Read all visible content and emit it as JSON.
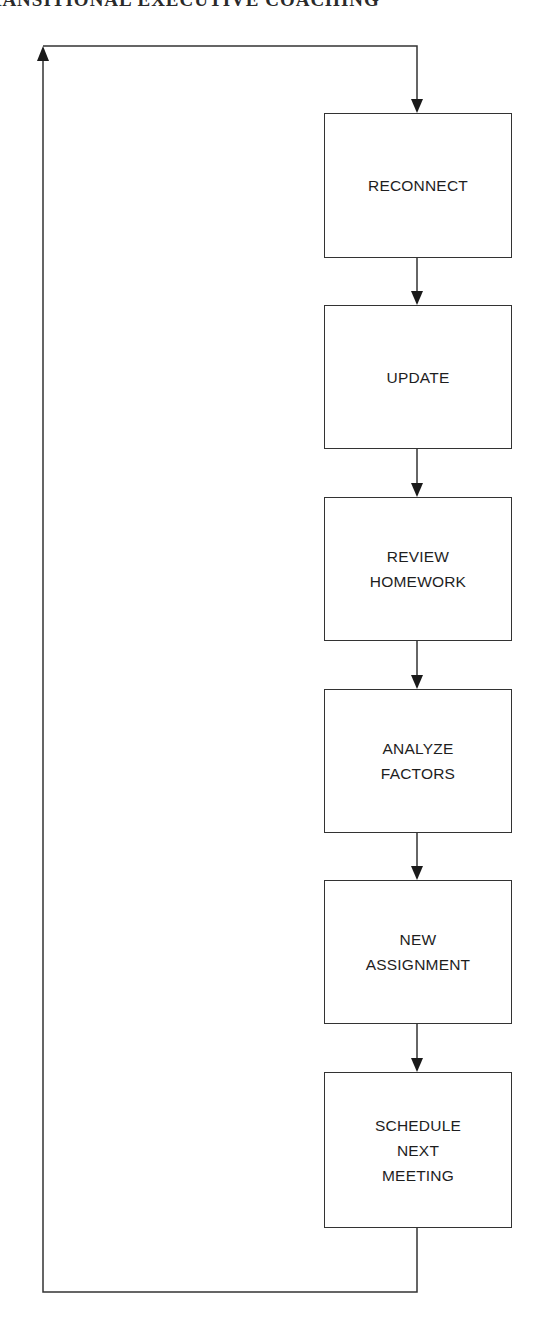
{
  "page": {
    "running_head": "TRANSITIONAL EXECUTIVE COACHING"
  },
  "diagram": {
    "type": "cyclic-flowchart",
    "line_color": "#333333",
    "steps": [
      {
        "label": "RECONNECT",
        "top": 113,
        "height": 145
      },
      {
        "label": "UPDATE",
        "top": 305,
        "height": 144
      },
      {
        "label": "REVIEW\nHOMEWORK",
        "top": 497,
        "height": 144
      },
      {
        "label": "ANALYZE\nFACTORS",
        "top": 689,
        "height": 144
      },
      {
        "label": "NEW\nASSIGNMENT",
        "top": 880,
        "height": 144
      },
      {
        "label": "SCHEDULE\nNEXT\nMEETING",
        "top": 1072,
        "height": 156
      }
    ],
    "loop": {
      "description": "Return arrow from SCHEDULE NEXT MEETING back to RECONNECT",
      "left_x": 43,
      "top_y": 46,
      "bottom_y": 1292
    }
  }
}
